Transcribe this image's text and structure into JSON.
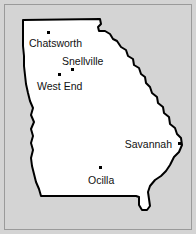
{
  "map": {
    "title": "Georgia state outline map",
    "background_color": "#d4d4d4",
    "state_fill_color": "#ffffff",
    "state_outline_color": "#000000",
    "frame_color": "#9a9a9a",
    "dot_color": "#000000",
    "label_color": "#111111",
    "cities": [
      {
        "name": "Chatsworth",
        "dot_x": 47,
        "dot_y": 33,
        "label_x": 29,
        "label_y": 47,
        "label_anchor": "start"
      },
      {
        "name": "Snellville",
        "dot_x": 71,
        "dot_y": 70,
        "label_x": 62,
        "label_y": 65,
        "label_anchor": "start"
      },
      {
        "name": "West End",
        "dot_x": 58,
        "dot_y": 75,
        "label_x": 37,
        "label_y": 90,
        "label_anchor": "start"
      },
      {
        "name": "Savannah",
        "dot_x": 178,
        "dot_y": 144,
        "label_x": 172,
        "label_y": 148,
        "label_anchor": "end"
      },
      {
        "name": "Ocilla",
        "dot_x": 99,
        "dot_y": 168,
        "label_x": 88,
        "label_y": 184,
        "label_anchor": "start"
      }
    ],
    "outline_path": "M 23,20 L 100,19 L 101,24 L 98,27 L 99,31 L 105,31 L 110,34 L 113,39 L 117,41 L 121,47 L 126,50 L 128,56 L 133,59 L 134,65 L 139,68 L 141,74 L 145,77 L 146,83 L 150,87 L 152,93 L 157,97 L 158,103 L 163,107 L 164,113 L 169,117 L 170,124 L 175,128 L 177,134 L 181,138 L 182,145 L 179,152 L 174,157 L 170,165 L 166,171 L 161,176 L 155,180 L 150,186 L 148,192 L 149,199 L 150,206 L 147,210 L 142,210 L 139,205 L 139,197 L 136,196 L 60,196 L 41,196 L 39,189 L 36,182 L 34,174 L 32,166 L 31,158 L 33,150 L 31,143 L 33,136 L 31,129 L 34,122 L 31,115 L 33,108 L 30,101 L 28,93 L 26,84 L 25,75 L 24,66 L 24,56 L 23,46 L 23,33 Z"
  }
}
